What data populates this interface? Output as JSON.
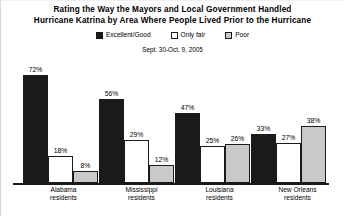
{
  "chart_data": {
    "type": "bar",
    "title": "Rating the Way the Mayors and Local Government Handled Hurricane Katrina by Area Where People Lived Prior to the Hurricane",
    "title_lines": [
      "Rating the Way the Mayors and Local Government Handled",
      "Hurricane Katrina by Area Where People Lived Prior to the Hurricane"
    ],
    "subtitle": "Sept. 30-Oct. 9, 2005",
    "xlabel": "",
    "ylabel": "",
    "ylim": [
      0,
      80
    ],
    "grid": false,
    "legend_position": "top",
    "categories": [
      "Alabama residents",
      "Mississippi residents",
      "Louisiana residents",
      "New Orleans residents"
    ],
    "category_lines": [
      [
        "Alabama",
        "residents"
      ],
      [
        "Mississippi",
        "residents"
      ],
      [
        "Louisiana",
        "residents"
      ],
      [
        "New Orleans",
        "residents"
      ]
    ],
    "series": [
      {
        "name": "Excellent/Good",
        "color": "#1a1a1a",
        "values": [
          72,
          56,
          47,
          33
        ],
        "labels": [
          "72%",
          "56%",
          "47%",
          "33%"
        ]
      },
      {
        "name": "Only fair",
        "color": "#ffffff",
        "values": [
          18,
          29,
          25,
          27
        ],
        "labels": [
          "18%",
          "29%",
          "25%",
          "27%"
        ]
      },
      {
        "name": "Poor",
        "color": "#c9c9c9",
        "values": [
          8,
          12,
          26,
          38
        ],
        "labels": [
          "8%",
          "12%",
          "26%",
          "38%"
        ]
      }
    ]
  },
  "legend": {
    "items": [
      {
        "label": "Excellent/Good",
        "swatch": "#1a1a1a"
      },
      {
        "label": "Only fair",
        "swatch": "#ffffff"
      },
      {
        "label": "Poor",
        "swatch": "#c9c9c9"
      }
    ]
  }
}
